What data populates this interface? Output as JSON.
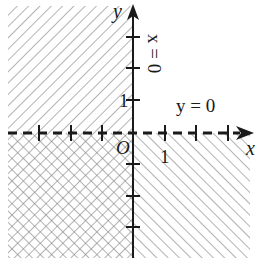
{
  "diagram": {
    "type": "coordinate-plane-regions",
    "axes": {
      "x_label": "x",
      "y_label": "y",
      "origin_label": "O",
      "x_unit_label": "1",
      "y_unit_label": "1"
    },
    "boundary_lines": [
      {
        "equation": "y = 0",
        "style": "dashed"
      },
      {
        "equation": "x = 0",
        "style": "solid"
      }
    ],
    "regions": [
      {
        "quadrant": "upper-left",
        "fill": "diagonal-hatch-forward"
      },
      {
        "quadrant": "lower-left",
        "fill": "cross-hatch"
      },
      {
        "quadrant": "lower-right",
        "fill": "diagonal-hatch-backward"
      },
      {
        "quadrant": "upper-right",
        "fill": "none"
      }
    ],
    "colors": {
      "ink": "#1a1a1a",
      "hatch": "#8a8a8a",
      "background": "#ffffff"
    }
  }
}
